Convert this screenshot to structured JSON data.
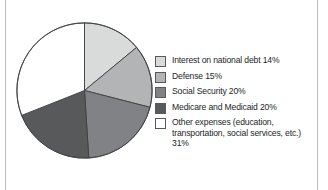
{
  "figure": {
    "background_color": "#ffffff",
    "rule_color": "#b9bcbe"
  },
  "chart_data": {
    "type": "pie",
    "title": "",
    "subtitle": "",
    "xlabel": "",
    "ylabel": "",
    "grid": false,
    "legend_position": "right",
    "start_angle_deg": 0,
    "direction": "clockwise",
    "total_percent": 100,
    "units": "percent",
    "categories": [
      "Interest on national debt",
      "Defense",
      "Social Security",
      "Medicare and Medicaid",
      "Other expenses (education, transportation, social services, etc.)"
    ],
    "values": [
      14,
      15,
      20,
      20,
      31
    ],
    "colors": [
      "#d9dada",
      "#b3b4b5",
      "#808285",
      "#58595b",
      "#ffffff"
    ],
    "slice_outline_color": "#3f4042",
    "slices": [
      {
        "label": "Interest on national debt",
        "value": 14,
        "display_value": "14%",
        "color": "#d9dada",
        "start_deg": 0,
        "end_deg": 50.4
      },
      {
        "label": "Defense",
        "value": 15,
        "display_value": "15%",
        "color": "#b3b4b5",
        "start_deg": 50.4,
        "end_deg": 104.4
      },
      {
        "label": "Social Security",
        "value": 20,
        "display_value": "20%",
        "color": "#808285",
        "start_deg": 104.4,
        "end_deg": 176.4
      },
      {
        "label": "Medicare and Medicaid",
        "value": 20,
        "display_value": "20%",
        "color": "#58595b",
        "start_deg": 176.4,
        "end_deg": 248.4
      },
      {
        "label": "Other expenses (education, transportation, social services, etc.)",
        "value": 31,
        "display_value": "31%",
        "color": "#ffffff",
        "start_deg": 248.4,
        "end_deg": 360
      }
    ]
  },
  "legend": {
    "items": [
      {
        "text": "Interest on national debt 14%",
        "color": "#d9dada",
        "swatch_name": "legend-swatch-interest-on-national-debt"
      },
      {
        "text": "Defense 15%",
        "color": "#b3b4b5",
        "swatch_name": "legend-swatch-defense"
      },
      {
        "text": "Social Security 20%",
        "color": "#808285",
        "swatch_name": "legend-swatch-social-security"
      },
      {
        "text": "Medicare and Medicaid 20%",
        "color": "#58595b",
        "swatch_name": "legend-swatch-medicare-and-medicaid"
      },
      {
        "text": "Other expenses (education, transportation, social services, etc.) 31%",
        "color": "#ffffff",
        "swatch_name": "legend-swatch-other-expenses"
      }
    ]
  }
}
